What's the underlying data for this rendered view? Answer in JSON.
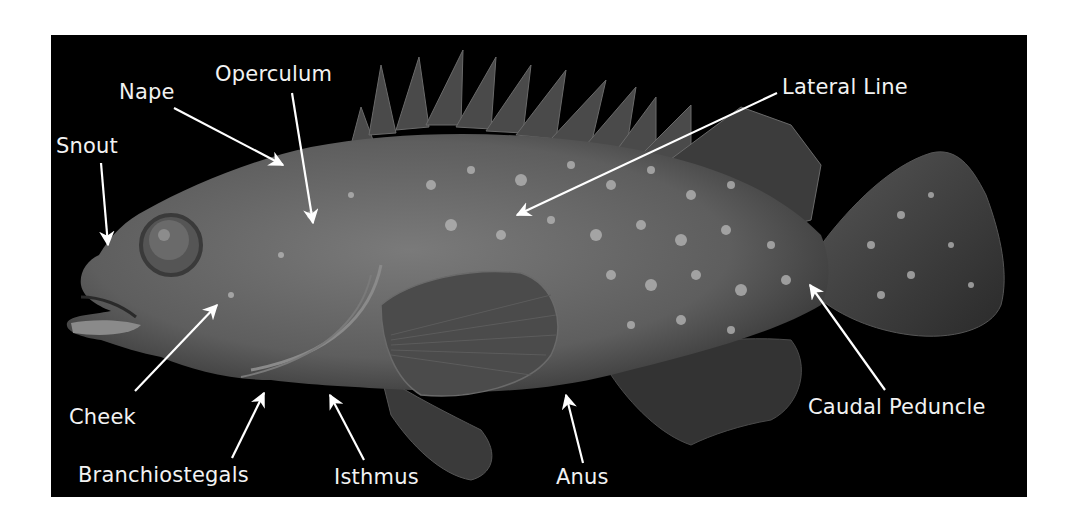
{
  "diagram": {
    "colors": {
      "background": "#ffffff",
      "panel": "#000000",
      "label": "#f2f2f2",
      "arrow": "#ffffff",
      "fish_body": "#6e6e6e",
      "spots": "#bdbdbd"
    },
    "labels": [
      {
        "id": "snout",
        "text": "Snout",
        "x": 5,
        "y": 101
      },
      {
        "id": "nape",
        "text": "Nape",
        "x": 68,
        "y": 47
      },
      {
        "id": "operculum",
        "text": "Operculum",
        "x": 164,
        "y": 29
      },
      {
        "id": "lateral-line",
        "text": "Lateral Line",
        "x": 731,
        "y": 42
      },
      {
        "id": "cheek",
        "text": "Cheek",
        "x": 18,
        "y": 372
      },
      {
        "id": "branchiostegals",
        "text": "Branchiostegals",
        "x": 27,
        "y": 430
      },
      {
        "id": "isthmus",
        "text": "Isthmus",
        "x": 283,
        "y": 432
      },
      {
        "id": "anus",
        "text": "Anus",
        "x": 505,
        "y": 432
      },
      {
        "id": "caudal-peduncle",
        "text": "Caudal Peduncle",
        "x": 757,
        "y": 362
      }
    ]
  }
}
